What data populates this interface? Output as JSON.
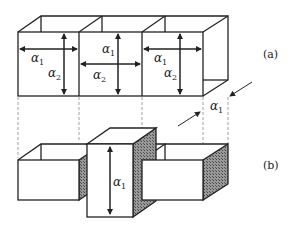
{
  "figure": {
    "panel_a": {
      "caption": "(a)"
    },
    "panel_b": {
      "caption": "(b)"
    },
    "labels": {
      "alpha": "α",
      "sub1": "1",
      "sub2": "2"
    },
    "colors": {
      "stroke": "#222222",
      "hatch": "#555555",
      "dash": "#888888"
    }
  }
}
